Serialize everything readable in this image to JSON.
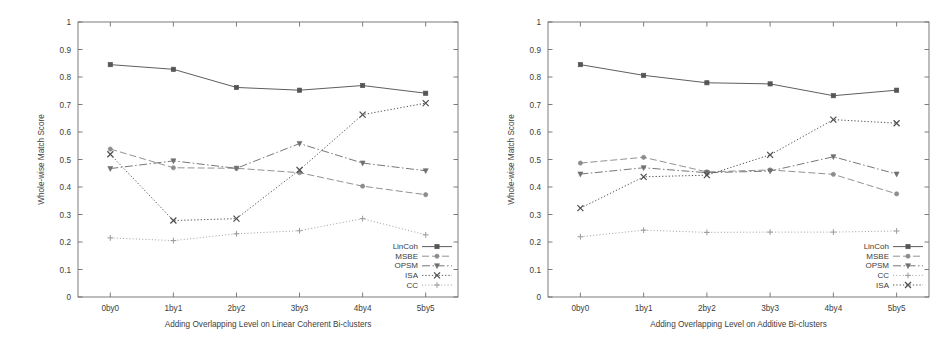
{
  "figure": {
    "panels": [
      {
        "id": "linear-coherent",
        "xlabel": "Adding Overlapping Level on Linear Coherent Bi-clusters",
        "ylabel": "Whole-wise Match Score",
        "legend_order": [
          "LinCoh",
          "MSBE",
          "OPSM",
          "ISA",
          "CC"
        ]
      },
      {
        "id": "additive",
        "xlabel": "Adding Overlapping Level on Additive Bi-clusters",
        "ylabel": "Whole-wise Match Score",
        "legend_order": [
          "LinCoh",
          "MSBE",
          "OPSM",
          "CC",
          "ISA"
        ]
      }
    ]
  },
  "chart_data": [
    {
      "type": "line",
      "title": "",
      "xlabel": "Adding Overlapping Level on Linear Coherent Bi-clusters",
      "ylabel": "Whole-wise Match Score",
      "categories": [
        "0by0",
        "1by1",
        "2by2",
        "3by3",
        "4by4",
        "5by5"
      ],
      "ylim": [
        0,
        1
      ],
      "yticks": [
        0,
        0.1,
        0.2,
        0.3,
        0.4,
        0.5,
        0.6,
        0.7,
        0.8,
        0.9,
        1
      ],
      "ytick_labels": [
        "0",
        "0.1",
        "0.2",
        "0.3",
        "0.4",
        "0.5",
        "0.6",
        "0.7",
        "0.8",
        "0.9",
        "1"
      ],
      "grid": false,
      "legend_position": "bottom-right",
      "series": [
        {
          "name": "LinCoh",
          "values": [
            0.845,
            0.828,
            0.762,
            0.752,
            0.769,
            0.741
          ],
          "color": "#555555",
          "dash": "none",
          "marker": "square"
        },
        {
          "name": "MSBE",
          "values": [
            0.538,
            0.47,
            0.468,
            0.452,
            0.403,
            0.372
          ],
          "color": "#8c8c8c",
          "dash": "long",
          "marker": "circle"
        },
        {
          "name": "OPSM",
          "values": [
            0.467,
            0.495,
            0.468,
            0.558,
            0.487,
            0.459
          ],
          "color": "#707070",
          "dash": "dashdot",
          "marker": "triangle-down"
        },
        {
          "name": "ISA",
          "values": [
            0.519,
            0.278,
            0.285,
            0.462,
            0.663,
            0.705
          ],
          "color": "#4f4f4f",
          "dash": "dotted",
          "marker": "cross"
        },
        {
          "name": "CC",
          "values": [
            0.215,
            0.205,
            0.23,
            0.241,
            0.285,
            0.226
          ],
          "color": "#9a9a9a",
          "dash": "fine",
          "marker": "plus"
        }
      ]
    },
    {
      "type": "line",
      "title": "",
      "xlabel": "Adding Overlapping Level on Additive Bi-clusters",
      "ylabel": "Whole-wise Match Score",
      "categories": [
        "0by0",
        "1by1",
        "2by2",
        "3by3",
        "4by4",
        "5by5"
      ],
      "ylim": [
        0,
        1
      ],
      "yticks": [
        0,
        0.1,
        0.2,
        0.3,
        0.4,
        0.5,
        0.6,
        0.7,
        0.8,
        0.9,
        1
      ],
      "ytick_labels": [
        "0",
        "0.1",
        "0.2",
        "0.3",
        "0.4",
        "0.5",
        "0.6",
        "0.7",
        "0.8",
        "0.9",
        "1"
      ],
      "grid": false,
      "legend_position": "bottom-right",
      "series": [
        {
          "name": "LinCoh",
          "values": [
            0.845,
            0.806,
            0.779,
            0.775,
            0.732,
            0.752
          ],
          "color": "#555555",
          "dash": "none",
          "marker": "square"
        },
        {
          "name": "MSBE",
          "values": [
            0.487,
            0.508,
            0.455,
            0.462,
            0.446,
            0.375
          ],
          "color": "#8c8c8c",
          "dash": "long",
          "marker": "circle"
        },
        {
          "name": "OPSM",
          "values": [
            0.447,
            0.47,
            0.452,
            0.458,
            0.51,
            0.447
          ],
          "color": "#707070",
          "dash": "dashdot",
          "marker": "triangle-down"
        },
        {
          "name": "CC",
          "values": [
            0.219,
            0.243,
            0.235,
            0.236,
            0.236,
            0.24
          ],
          "color": "#9a9a9a",
          "dash": "fine",
          "marker": "plus"
        },
        {
          "name": "ISA",
          "values": [
            0.323,
            0.437,
            0.443,
            0.517,
            0.645,
            0.632
          ],
          "color": "#4f4f4f",
          "dash": "dotted",
          "marker": "cross"
        }
      ]
    }
  ]
}
